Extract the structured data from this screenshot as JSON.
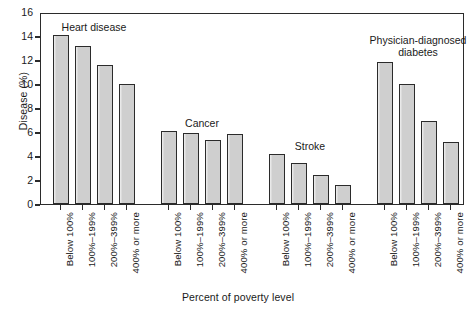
{
  "chart_data": {
    "type": "bar",
    "title": "",
    "xlabel": "Percent of poverty level",
    "ylabel": "Disease (%)",
    "ylim": [
      0,
      16
    ],
    "yticks": [
      0,
      2,
      4,
      6,
      8,
      10,
      12,
      14,
      16
    ],
    "grid": false,
    "legend": "none",
    "categories": [
      "Below 100%",
      "100%–199%",
      "200%–399%",
      "400% or more"
    ],
    "groups": [
      {
        "name": "Heart disease",
        "label": "Heart disease",
        "values": [
          14.1,
          13.2,
          11.6,
          10.0
        ]
      },
      {
        "name": "Cancer",
        "label": "Cancer",
        "values": [
          6.1,
          5.9,
          5.3,
          5.85
        ]
      },
      {
        "name": "Stroke",
        "label": "Stroke",
        "values": [
          4.2,
          3.45,
          2.45,
          1.55
        ]
      },
      {
        "name": "Physician-diagnosed diabetes",
        "label": "Physician-diagnosed\ndiabetes",
        "values": [
          11.85,
          10.0,
          6.95,
          5.15
        ]
      }
    ],
    "colors": {
      "bar_fill": "#cfcfcf",
      "bar_edge": "#2b2b2b",
      "axis": "#2b2b2b",
      "background": "#ffffff"
    }
  }
}
